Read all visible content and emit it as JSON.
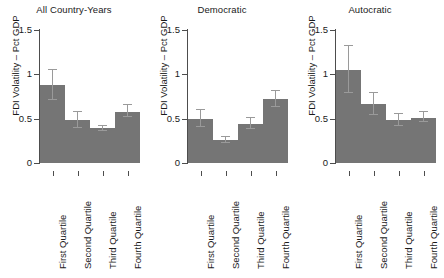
{
  "figure": {
    "width": 444,
    "height": 278,
    "bar_color": "#757575",
    "error_color": "#9a9a9a",
    "axis_color": "#4d4d4d",
    "background": "#ffffff"
  },
  "chart_data": {
    "type": "bar",
    "title": "",
    "xlabel": "",
    "ylabel": "FDI Volatility – Pct GDP",
    "ylim": [
      0,
      1.5
    ],
    "ytick_labels": [
      "1.5",
      "1",
      "0.5",
      "0"
    ],
    "ytick_values": [
      1.5,
      1,
      0.5,
      0
    ],
    "grid": false,
    "legend": "none",
    "categories": [
      "First Quartile",
      "Second Quartile",
      "Third Quartile",
      "Fourth Quartile"
    ],
    "panels": [
      {
        "title": "All Country-Years",
        "values": [
          0.88,
          0.48,
          0.39,
          0.58
        ],
        "err_low": [
          0.71,
          0.4,
          0.36,
          0.52
        ],
        "err_high": [
          1.05,
          0.57,
          0.42,
          0.65
        ]
      },
      {
        "title": "Democratic",
        "values": [
          0.5,
          0.26,
          0.44,
          0.72
        ],
        "err_low": [
          0.41,
          0.23,
          0.38,
          0.63
        ],
        "err_high": [
          0.6,
          0.29,
          0.51,
          0.81
        ]
      },
      {
        "title": "Autocratic",
        "values": [
          1.05,
          0.66,
          0.48,
          0.51
        ],
        "err_low": [
          0.79,
          0.54,
          0.42,
          0.46
        ],
        "err_high": [
          1.32,
          0.79,
          0.55,
          0.57
        ]
      }
    ]
  }
}
